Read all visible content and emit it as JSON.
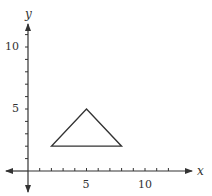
{
  "chart_data": {
    "type": "line",
    "title": "",
    "xlabel": "x",
    "ylabel": "y",
    "xlim": [
      -2,
      14
    ],
    "ylim": [
      -2,
      12
    ],
    "grid": false,
    "x_ticks": [
      1,
      2,
      3,
      4,
      5,
      6,
      7,
      8,
      9,
      10,
      11,
      12
    ],
    "y_ticks": [
      1,
      2,
      3,
      4,
      5,
      6,
      7,
      8,
      9,
      10,
      11
    ],
    "x_tick_labels": [
      {
        "value": 5,
        "label": "5"
      },
      {
        "value": 10,
        "label": "10"
      }
    ],
    "y_tick_labels": [
      {
        "value": 5,
        "label": "5"
      },
      {
        "value": 10,
        "label": "10"
      }
    ],
    "series": [
      {
        "name": "triangle",
        "closed": true,
        "points": [
          [
            2,
            2
          ],
          [
            5,
            5
          ],
          [
            8,
            2
          ]
        ],
        "color": "#333333"
      }
    ]
  },
  "labels": {
    "x_axis": "x",
    "y_axis": "y",
    "x5": "5",
    "x10": "10",
    "y5": "5",
    "y10": "10"
  }
}
